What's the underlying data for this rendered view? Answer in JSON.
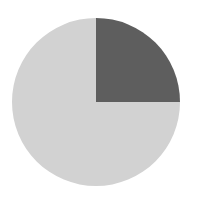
{
  "chart_data": {
    "type": "pie",
    "title": "",
    "categories": [
      "Slice A",
      "Slice B"
    ],
    "values": [
      25,
      75
    ],
    "colors": [
      "#5e5e5e",
      "#d2d2d2"
    ],
    "start_angle_deg": 90,
    "direction": "clockwise",
    "legend": "none",
    "labels_shown": false
  },
  "layout": {
    "center_x": 96,
    "center_y": 102,
    "radius": 84,
    "background": "#ffffff"
  }
}
